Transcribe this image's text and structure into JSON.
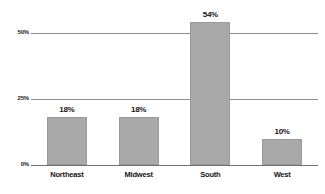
{
  "chart_data": {
    "type": "bar",
    "title": "",
    "subtitle": "",
    "xlabel": "",
    "ylabel": "",
    "categories": [
      "Northeast",
      "Midwest",
      "South",
      "West"
    ],
    "values": [
      18,
      18,
      54,
      10
    ],
    "value_labels": [
      "18%",
      "18%",
      "54%",
      "10%"
    ],
    "ylim": [
      0,
      54
    ],
    "yticks": [
      0,
      25,
      50
    ],
    "ytick_labels": [
      "0%",
      "25%",
      "50%"
    ],
    "grid": true,
    "gridlines_at": [
      25,
      50
    ],
    "legend": false,
    "legend_position": "none",
    "series": [
      {
        "name": "",
        "values": [
          18,
          18,
          54,
          10
        ]
      }
    ],
    "colors": {
      "bar_fill": "#a9a9a9",
      "bar_border": "#9a9a9a",
      "gridline": "#8e8e8e",
      "axis": "#6f6f6f",
      "text": "#141414",
      "background": "#ffffff"
    }
  }
}
